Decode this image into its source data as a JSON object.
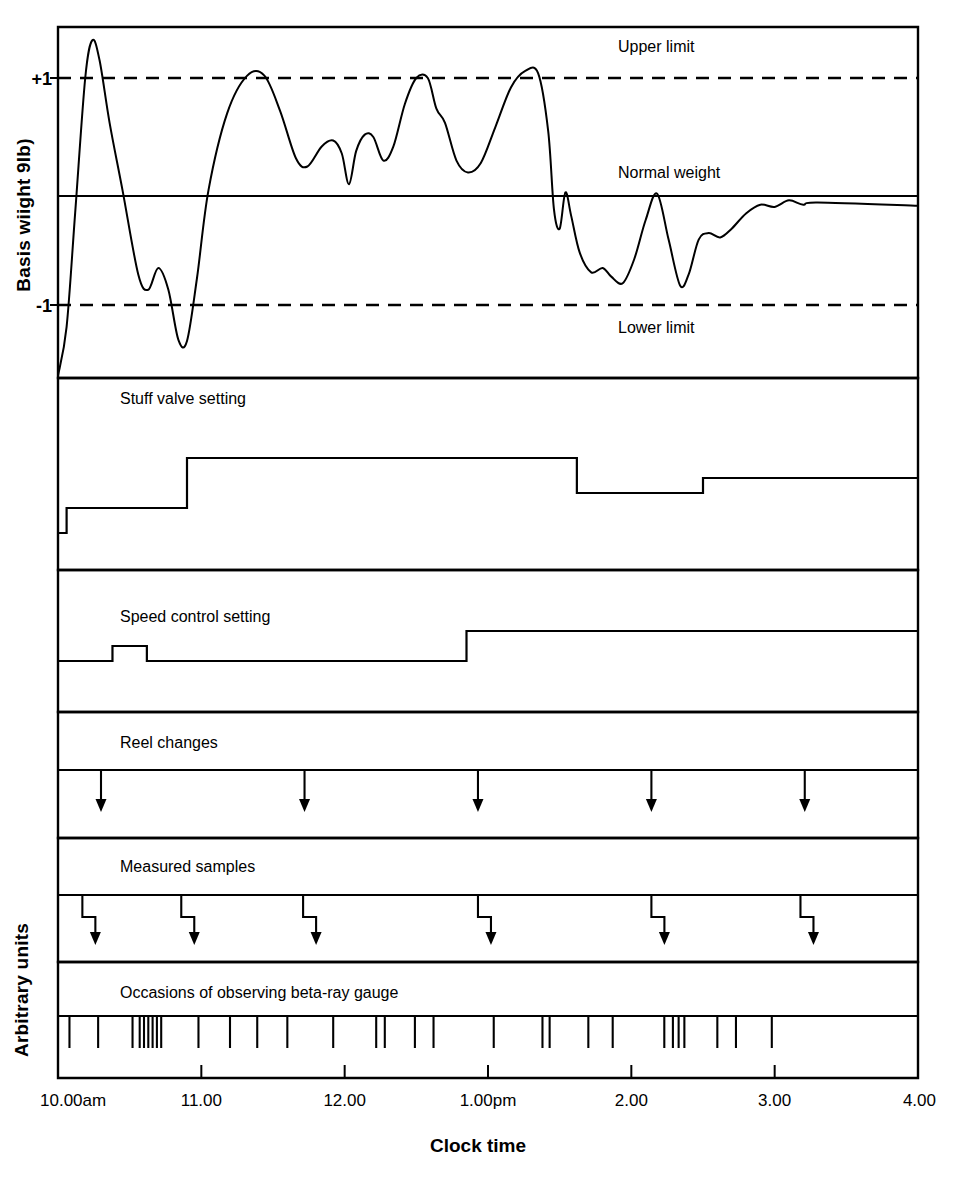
{
  "axes": {
    "y_axis_label_top": "Basis wiight 9lb)",
    "y_axis_label_bottom": "Arbitrary units",
    "x_axis_title": "Clock time",
    "y_tick_plus_one": "+1",
    "y_tick_minus_one": "-1"
  },
  "annotations": {
    "upper_limit": "Upper limit",
    "normal_weight": "Normal weight",
    "lower_limit": "Lower limit"
  },
  "panels": {
    "stuff_valve": "Stuff valve setting",
    "speed_control": "Speed control setting",
    "reel_changes": "Reel changes",
    "measured_samples": "Measured samples",
    "beta_ray": "Occasions of observing beta-ray gauge"
  },
  "colors": {
    "ink": "#000000",
    "paper": "#ffffff"
  },
  "chart_data": {
    "type": "line",
    "title": "",
    "subtitle": "",
    "xlabel": "Clock time",
    "ylabel": "Basis wiight 9lb)",
    "ylabel_secondary": "Arbitrary units",
    "grid": false,
    "legend": "none",
    "x": {
      "tick_labels": [
        "10.00am",
        "11.00",
        "12.00",
        "1.00pm",
        "2.00",
        "3.00",
        "4.00"
      ],
      "tick_hours": [
        10,
        11,
        12,
        13,
        14,
        15,
        16
      ],
      "range_hours": [
        10,
        16
      ]
    },
    "reference_lines": [
      {
        "name": "Upper limit",
        "y": 1,
        "style": "dashed",
        "label": "Upper limit"
      },
      {
        "name": "Normal weight",
        "y": 0,
        "style": "solid",
        "label": "Normal weight"
      },
      {
        "name": "Lower limit",
        "y": -1,
        "style": "dashed",
        "label": "Lower limit"
      }
    ],
    "series": [
      {
        "name": "Basis weight",
        "panel": "basis-weight",
        "ylim": [
          -2.0,
          1.7
        ],
        "units": "arbitrary (deviation from normal weight)",
        "points": [
          {
            "t": 10.0,
            "y": -1.65
          },
          {
            "t": 10.06,
            "y": -1.2
          },
          {
            "t": 10.12,
            "y": -0.15
          },
          {
            "t": 10.19,
            "y": 1.0
          },
          {
            "t": 10.24,
            "y": 1.32
          },
          {
            "t": 10.29,
            "y": 1.15
          },
          {
            "t": 10.36,
            "y": 0.62
          },
          {
            "t": 10.45,
            "y": 0.05
          },
          {
            "t": 10.56,
            "y": -0.72
          },
          {
            "t": 10.63,
            "y": -0.86
          },
          {
            "t": 10.7,
            "y": -0.66
          },
          {
            "t": 10.77,
            "y": -0.86
          },
          {
            "t": 10.84,
            "y": -1.32
          },
          {
            "t": 10.9,
            "y": -1.33
          },
          {
            "t": 10.97,
            "y": -0.75
          },
          {
            "t": 11.05,
            "y": 0.05
          },
          {
            "t": 11.18,
            "y": 0.7
          },
          {
            "t": 11.32,
            "y": 1.02
          },
          {
            "t": 11.44,
            "y": 1.02
          },
          {
            "t": 11.55,
            "y": 0.72
          },
          {
            "t": 11.66,
            "y": 0.32
          },
          {
            "t": 11.74,
            "y": 0.25
          },
          {
            "t": 11.84,
            "y": 0.42
          },
          {
            "t": 11.92,
            "y": 0.47
          },
          {
            "t": 11.98,
            "y": 0.36
          },
          {
            "t": 12.03,
            "y": 0.1
          },
          {
            "t": 12.08,
            "y": 0.38
          },
          {
            "t": 12.14,
            "y": 0.52
          },
          {
            "t": 12.2,
            "y": 0.5
          },
          {
            "t": 12.27,
            "y": 0.3
          },
          {
            "t": 12.34,
            "y": 0.42
          },
          {
            "t": 12.42,
            "y": 0.78
          },
          {
            "t": 12.5,
            "y": 1.0
          },
          {
            "t": 12.58,
            "y": 1.0
          },
          {
            "t": 12.64,
            "y": 0.74
          },
          {
            "t": 12.7,
            "y": 0.62
          },
          {
            "t": 12.78,
            "y": 0.3
          },
          {
            "t": 12.86,
            "y": 0.2
          },
          {
            "t": 12.95,
            "y": 0.28
          },
          {
            "t": 13.05,
            "y": 0.58
          },
          {
            "t": 13.16,
            "y": 0.92
          },
          {
            "t": 13.26,
            "y": 1.06
          },
          {
            "t": 13.35,
            "y": 1.04
          },
          {
            "t": 13.42,
            "y": 0.55
          },
          {
            "t": 13.46,
            "y": -0.12
          },
          {
            "t": 13.5,
            "y": -0.3
          },
          {
            "t": 13.54,
            "y": 0.03
          },
          {
            "t": 13.58,
            "y": -0.18
          },
          {
            "t": 13.64,
            "y": -0.52
          },
          {
            "t": 13.72,
            "y": -0.7
          },
          {
            "t": 13.8,
            "y": -0.66
          },
          {
            "t": 13.86,
            "y": -0.74
          },
          {
            "t": 13.94,
            "y": -0.8
          },
          {
            "t": 14.02,
            "y": -0.58
          },
          {
            "t": 14.1,
            "y": -0.22
          },
          {
            "t": 14.18,
            "y": 0.02
          },
          {
            "t": 14.26,
            "y": -0.4
          },
          {
            "t": 14.34,
            "y": -0.82
          },
          {
            "t": 14.4,
            "y": -0.72
          },
          {
            "t": 14.47,
            "y": -0.4
          },
          {
            "t": 14.54,
            "y": -0.34
          },
          {
            "t": 14.62,
            "y": -0.38
          },
          {
            "t": 14.7,
            "y": -0.3
          },
          {
            "t": 14.8,
            "y": -0.16
          },
          {
            "t": 14.9,
            "y": -0.08
          },
          {
            "t": 15.0,
            "y": -0.1
          },
          {
            "t": 15.1,
            "y": -0.04
          },
          {
            "t": 15.2,
            "y": -0.08
          },
          {
            "t": 15.3,
            "y": -0.06
          },
          {
            "t": 16.0,
            "y": -0.09
          }
        ]
      },
      {
        "name": "Stuff valve setting",
        "panel": "stuff-valve",
        "type": "step",
        "steps": [
          {
            "t_start": 10.0,
            "t_end": 10.06,
            "level": 0
          },
          {
            "t_start": 10.06,
            "t_end": 10.9,
            "level": 1
          },
          {
            "t_start": 10.9,
            "t_end": 13.62,
            "level": 3
          },
          {
            "t_start": 13.62,
            "t_end": 14.5,
            "level": 1.6
          },
          {
            "t_start": 14.5,
            "t_end": 16.0,
            "level": 2.2
          }
        ]
      },
      {
        "name": "Speed control setting",
        "panel": "speed-control",
        "type": "step",
        "steps": [
          {
            "t_start": 10.0,
            "t_end": 10.38,
            "level": 0
          },
          {
            "t_start": 10.38,
            "t_end": 10.62,
            "level": 1
          },
          {
            "t_start": 10.62,
            "t_end": 12.85,
            "level": 0
          },
          {
            "t_start": 12.85,
            "t_end": 16.0,
            "level": 2
          }
        ]
      }
    ],
    "events": [
      {
        "name": "Reel changes",
        "panel": "reel-changes",
        "marker": "arrow-down",
        "times": [
          10.3,
          11.72,
          12.93,
          14.14,
          15.21
        ]
      },
      {
        "name": "Measured samples",
        "panel": "measured-samples",
        "marker": "stepped-arrow-down",
        "times": [
          10.17,
          10.86,
          11.71,
          12.93,
          14.14,
          15.18
        ]
      },
      {
        "name": "Occasions of observing beta-ray gauge",
        "panel": "beta-ray",
        "marker": "tick",
        "times": [
          10.08,
          10.28,
          10.52,
          10.57,
          10.6,
          10.63,
          10.66,
          10.69,
          10.72,
          10.98,
          11.2,
          11.39,
          11.6,
          11.92,
          12.22,
          12.28,
          12.49,
          12.62,
          13.04,
          13.38,
          13.43,
          13.7,
          13.87,
          14.23,
          14.29,
          14.33,
          14.37,
          14.6,
          14.73,
          14.98
        ]
      }
    ]
  }
}
